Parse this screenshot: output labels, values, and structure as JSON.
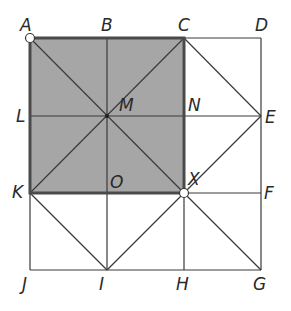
{
  "diagram": {
    "colors": {
      "shade": "#a6a6a6",
      "line": "#3a3a3a",
      "thick": "#4a4a4a",
      "bg": "#ffffff",
      "label": "#2a2a2a"
    },
    "points": {
      "A": {
        "x": 30,
        "y": 38
      },
      "B": {
        "x": 107,
        "y": 38
      },
      "C": {
        "x": 184,
        "y": 38
      },
      "D": {
        "x": 261,
        "y": 38
      },
      "L": {
        "x": 30,
        "y": 116
      },
      "M": {
        "x": 107,
        "y": 116
      },
      "N": {
        "x": 184,
        "y": 116
      },
      "E": {
        "x": 261,
        "y": 116
      },
      "K": {
        "x": 30,
        "y": 193
      },
      "O": {
        "x": 107,
        "y": 193
      },
      "X": {
        "x": 184,
        "y": 193
      },
      "F": {
        "x": 261,
        "y": 193
      },
      "J": {
        "x": 30,
        "y": 270
      },
      "I": {
        "x": 107,
        "y": 270
      },
      "H": {
        "x": 184,
        "y": 270
      },
      "G": {
        "x": 261,
        "y": 270
      }
    },
    "labels": [
      {
        "text": "A",
        "x": 20,
        "y": 31
      },
      {
        "text": "B",
        "x": 101,
        "y": 31
      },
      {
        "text": "C",
        "x": 178,
        "y": 31
      },
      {
        "text": "D",
        "x": 255,
        "y": 31
      },
      {
        "text": "L",
        "x": 16,
        "y": 122
      },
      {
        "text": "M",
        "x": 119,
        "y": 111
      },
      {
        "text": "N",
        "x": 188,
        "y": 111
      },
      {
        "text": "E",
        "x": 265,
        "y": 123
      },
      {
        "text": "K",
        "x": 12,
        "y": 198
      },
      {
        "text": "O",
        "x": 110,
        "y": 188
      },
      {
        "text": "X",
        "x": 188,
        "y": 185
      },
      {
        "text": "F",
        "x": 264,
        "y": 199
      },
      {
        "text": "J",
        "x": 22,
        "y": 290
      },
      {
        "text": "I",
        "x": 99,
        "y": 290
      },
      {
        "text": "H",
        "x": 176,
        "y": 290
      },
      {
        "text": "G",
        "x": 253,
        "y": 290
      }
    ],
    "shaded_region": [
      "A",
      "C",
      "X",
      "K"
    ],
    "marked_points": [
      "A",
      "X"
    ],
    "segments": [
      [
        "A",
        "D"
      ],
      [
        "L",
        "E"
      ],
      [
        "K",
        "F"
      ],
      [
        "J",
        "G"
      ],
      [
        "A",
        "J"
      ],
      [
        "B",
        "I"
      ],
      [
        "C",
        "H"
      ],
      [
        "D",
        "G"
      ],
      [
        "A",
        "X"
      ],
      [
        "C",
        "K"
      ],
      [
        "C",
        "E"
      ],
      [
        "E",
        "X"
      ],
      [
        "K",
        "I"
      ],
      [
        "I",
        "X"
      ],
      [
        "X",
        "G"
      ]
    ]
  }
}
